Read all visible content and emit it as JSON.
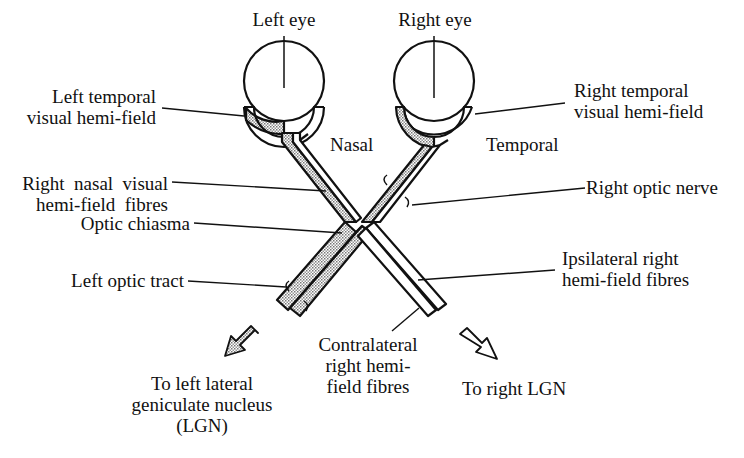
{
  "diagram": {
    "colors": {
      "ink": "#111111",
      "stipple": "#bdbdbd",
      "background": "#ffffff"
    },
    "labels": {
      "left_eye": "Left eye",
      "right_eye": "Right eye",
      "left_temporal_1": "Left temporal",
      "left_temporal_2": "visual hemi-field",
      "right_temporal_1": "Right temporal",
      "right_temporal_2": "visual hemi-field",
      "nasal": "Nasal",
      "temporal": "Temporal",
      "right_nasal_1": "Right  nasal  visual",
      "right_nasal_2": "hemi-field  fibres",
      "right_optic_nerve": "Right optic nerve",
      "optic_chiasma": "Optic chiasma",
      "ipsilateral_1": "Ipsilateral right",
      "ipsilateral_2": "hemi-field fibres",
      "left_optic_tract": "Left optic tract",
      "contralateral_1": "Contralateral",
      "contralateral_2": "right hemi-",
      "contralateral_3": "field fibres",
      "to_left_lgn_1": "To left lateral",
      "to_left_lgn_2": "geniculate nucleus",
      "to_left_lgn_3": "(LGN)",
      "to_right_lgn": "To right LGN"
    },
    "arrows": [
      {
        "name": "to-left-lgn-arrow",
        "direction": "down-left",
        "fill": "stippled"
      },
      {
        "name": "to-right-lgn-arrow",
        "direction": "down-right",
        "fill": "white"
      }
    ]
  }
}
